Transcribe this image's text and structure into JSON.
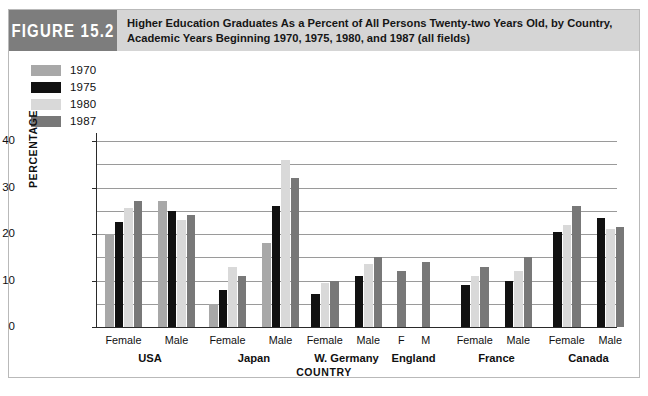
{
  "figure": {
    "number_label": "FIGURE 15.2",
    "title": "Higher Education Graduates As a Percent of All Persons Twenty-two Years Old, by Country, Academic Years Beginning 1970, 1975, 1980, and 1987 (all fields)"
  },
  "legend": {
    "position": "top-left",
    "entries": [
      {
        "label": "1970",
        "color": "#a8a8a8"
      },
      {
        "label": "1975",
        "color": "#111111"
      },
      {
        "label": "1980",
        "color": "#d9d9d9"
      },
      {
        "label": "1987",
        "color": "#787878"
      }
    ]
  },
  "colors": {
    "tab_background": "#7d7d7d",
    "title_background": "#d5d5d5",
    "gridline": "#9a9a9a",
    "axis": "#2a2a2a",
    "border": "#b9b9b9"
  },
  "chart_data": {
    "type": "bar",
    "title": "Higher Education Graduates As a Percent of All Persons Twenty-two Years Old, by Country, Academic Years Beginning 1970, 1975, 1980, and 1987 (all fields)",
    "xlabel": "COUNTRY",
    "ylabel": "PERCENTAGE",
    "ylim": [
      0,
      40
    ],
    "ytick_labels": [
      "0",
      "10",
      "20",
      "30",
      "40"
    ],
    "ytick_values": [
      0,
      10,
      20,
      30,
      40
    ],
    "gridline_values": [
      5,
      10,
      15,
      20,
      25,
      30,
      35,
      40
    ],
    "grid": true,
    "series_names": [
      "1970",
      "1975",
      "1980",
      "1987"
    ],
    "groups": [
      {
        "country": "USA",
        "subgroups": [
          {
            "label": "Female",
            "values": [
              20,
              22.5,
              25.5,
              27
            ]
          },
          {
            "label": "Male",
            "values": [
              27,
              25,
              23,
              24
            ]
          }
        ]
      },
      {
        "country": "Japan",
        "subgroups": [
          {
            "label": "Female",
            "values": [
              5,
              8,
              13,
              11
            ]
          },
          {
            "label": "Male",
            "values": [
              18,
              26,
              36,
              32
            ]
          }
        ]
      },
      {
        "country": "W. Germany",
        "subgroups": [
          {
            "label": "Female",
            "values": [
              null,
              7,
              9.5,
              10
            ]
          },
          {
            "label": "Male",
            "values": [
              null,
              11,
              13.5,
              15
            ]
          }
        ]
      },
      {
        "country": "England",
        "subgroups": [
          {
            "label": "F",
            "values": [
              null,
              null,
              null,
              12
            ]
          },
          {
            "label": "M",
            "values": [
              null,
              null,
              null,
              14
            ]
          }
        ]
      },
      {
        "country": "France",
        "subgroups": [
          {
            "label": "Female",
            "values": [
              null,
              9,
              11,
              13
            ]
          },
          {
            "label": "Male",
            "values": [
              null,
              10,
              12,
              15
            ]
          }
        ]
      },
      {
        "country": "Canada",
        "subgroups": [
          {
            "label": "Female",
            "values": [
              null,
              20.5,
              22,
              26
            ]
          },
          {
            "label": "Male",
            "values": [
              null,
              23.5,
              21,
              21.5
            ]
          }
        ]
      }
    ]
  }
}
